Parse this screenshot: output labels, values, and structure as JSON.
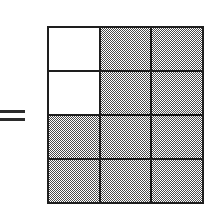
{
  "figure": {
    "equals_symbol": "=",
    "grid": {
      "columns": 3,
      "rows": 4,
      "total_cells": 12,
      "shaded_cells": 10,
      "unshaded_cells": 2,
      "fraction_shaded": "10/12",
      "shaded_color": "#4a4a4a",
      "unshaded_color": "#ffffff",
      "line_color": "#1e1e1e",
      "cells": [
        {
          "row": 1,
          "col": 1,
          "state": "unshaded"
        },
        {
          "row": 1,
          "col": 2,
          "state": "shaded"
        },
        {
          "row": 1,
          "col": 3,
          "state": "shaded"
        },
        {
          "row": 2,
          "col": 1,
          "state": "unshaded"
        },
        {
          "row": 2,
          "col": 2,
          "state": "shaded"
        },
        {
          "row": 2,
          "col": 3,
          "state": "shaded"
        },
        {
          "row": 3,
          "col": 1,
          "state": "shaded"
        },
        {
          "row": 3,
          "col": 2,
          "state": "shaded"
        },
        {
          "row": 3,
          "col": 3,
          "state": "shaded"
        },
        {
          "row": 4,
          "col": 1,
          "state": "shaded"
        },
        {
          "row": 4,
          "col": 2,
          "state": "shaded"
        },
        {
          "row": 4,
          "col": 3,
          "state": "shaded"
        }
      ]
    }
  }
}
